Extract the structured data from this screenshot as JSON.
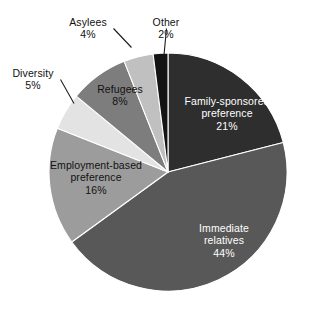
{
  "figure": {
    "background_color": "#ffffff",
    "width": 319,
    "height": 317
  },
  "chart_data": {
    "type": "pie",
    "title": "",
    "subtitle": "",
    "xlabel": "",
    "ylabel": "",
    "legend_position": "none",
    "grid": false,
    "label_format": "name + percent",
    "start_angle_deg": 0,
    "direction": "clockwise",
    "center": {
      "x": 168,
      "y": 172
    },
    "radius": 119,
    "categories": [
      "Family-sponsored preference",
      "Immediate relatives",
      "Employment-based preference",
      "Diversity",
      "Refugees",
      "Asylees",
      "Other"
    ],
    "values": [
      21,
      44,
      16,
      5,
      8,
      4,
      2
    ],
    "colors": [
      "#2e2e2e",
      "#585858",
      "#9c9c9c",
      "#e3e3e3",
      "#7d7d7d",
      "#c0c0c0",
      "#141414"
    ],
    "slices": [
      {
        "name": "Family-sponsored preference",
        "value": 21,
        "percent_label": "21%",
        "color": "#2e2e2e",
        "label_placement": "inside",
        "label_color": "#ffffff",
        "name_line_1": "Family-sponsored",
        "name_line_2": "preference"
      },
      {
        "name": "Immediate relatives",
        "value": 44,
        "percent_label": "44%",
        "color": "#585858",
        "label_placement": "inside",
        "label_color": "#ffffff",
        "name_line_1": "Immediate",
        "name_line_2": "relatives"
      },
      {
        "name": "Employment-based preference",
        "value": 16,
        "percent_label": "16%",
        "color": "#9c9c9c",
        "label_placement": "inside",
        "label_color": "#121212",
        "name_line_1": "Employment-based",
        "name_line_2": "preference"
      },
      {
        "name": "Diversity",
        "value": 5,
        "percent_label": "5%",
        "color": "#e3e3e3",
        "label_placement": "outside-leader",
        "label_color": "#111111",
        "name_line_1": "Diversity",
        "name_line_2": ""
      },
      {
        "name": "Refugees",
        "value": 8,
        "percent_label": "8%",
        "color": "#7d7d7d",
        "label_placement": "inside",
        "label_color": "#121212",
        "name_line_1": "Refugees",
        "name_line_2": ""
      },
      {
        "name": "Asylees",
        "value": 4,
        "percent_label": "4%",
        "color": "#c0c0c0",
        "label_placement": "outside-leader",
        "label_color": "#111111",
        "name_line_1": "Asylees",
        "name_line_2": ""
      },
      {
        "name": "Other",
        "value": 2,
        "percent_label": "2%",
        "color": "#141414",
        "label_placement": "outside-leader",
        "label_color": "#111111",
        "name_line_1": "Other",
        "name_line_2": ""
      }
    ]
  },
  "labels": {
    "family_sponsored": {
      "line1": "Family-sponsored",
      "line2": "preference",
      "pct": "21%"
    },
    "immediate_relatives": {
      "line1": "Immediate",
      "line2": "relatives",
      "pct": "44%"
    },
    "employment_based": {
      "line1": "Employment-based",
      "line2": "preference",
      "pct": "16%"
    },
    "refugees": {
      "line1": "Refugees",
      "pct": "8%"
    },
    "diversity": {
      "line1": "Diversity",
      "pct": "5%"
    },
    "asylees": {
      "line1": "Asylees",
      "pct": "4%"
    },
    "other": {
      "line1": "Other",
      "pct": "2%"
    }
  }
}
